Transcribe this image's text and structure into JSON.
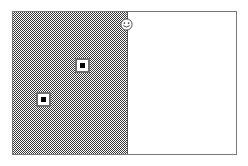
{
  "canvas": {
    "title": "Canvas",
    "frame": {
      "border_color": "#787878",
      "background_color": "#ffffff"
    },
    "panels": [
      {
        "id": "shaded-panel",
        "label": "Shaded region",
        "fill_style": "checkerboard-dither",
        "fill_color": "#3a3a3a",
        "background_color": "#ffffff",
        "edge_color": "#5a5a5a"
      },
      {
        "id": "white-panel",
        "label": "Open region",
        "fill_style": "solid",
        "fill_color": "#ffffff"
      }
    ],
    "icons": [
      {
        "name": "smiley-face-icon",
        "glyph": "smiley",
        "color": "#4a4a4a",
        "x": 107,
        "y": 6,
        "label": "Smiley"
      }
    ],
    "markers": [
      {
        "name": "node-marker-1",
        "x": 62,
        "y": 46,
        "border_color": "#6e6e6e",
        "fill_color": "#ffffff",
        "core_color": "#000000",
        "label": "Node 1"
      },
      {
        "name": "node-marker-2",
        "x": 23,
        "y": 80,
        "border_color": "#6e6e6e",
        "fill_color": "#ffffff",
        "core_color": "#000000",
        "label": "Node 2"
      }
    ]
  }
}
